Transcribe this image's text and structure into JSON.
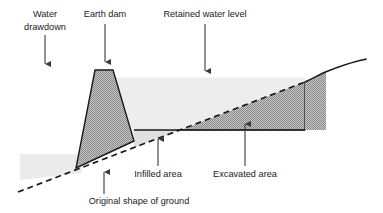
{
  "figure": {
    "type": "cross-section-diagram",
    "width": 383,
    "height": 213,
    "background": "#ffffff"
  },
  "labels": {
    "water_drawdown_line1": "Water",
    "water_drawdown_line2": "drawdown",
    "earth_dam": "Earth dam",
    "retained_water_level": "Retained water level",
    "infilled_area": "Infilled area",
    "excavated_area": "Excavated area",
    "original_shape_of_ground": "Original shape of ground"
  },
  "colors": {
    "outline": "#1a1a1a",
    "dam_fill": "#a9a9a9",
    "excavated_fill": "#9e9e9e",
    "retained_water_fill": "#ededed",
    "drawdown_water_fill": "#ebebeb",
    "infilled_fill": "#e0e0e0",
    "text": "#1a1a1a",
    "arrow": "#3a3a3a"
  },
  "geometry": {
    "original_ground_dashed": {
      "from": [
        18,
        192
      ],
      "to": [
        305,
        82
      ],
      "style": "dashed"
    },
    "right_ground_curve": {
      "points": [
        [
          305,
          82
        ],
        [
          318,
          76
        ],
        [
          332,
          71
        ],
        [
          345,
          67
        ],
        [
          356,
          63
        ],
        [
          363,
          61
        ],
        [
          366,
          60
        ]
      ],
      "style": "solid-curved"
    },
    "dam": {
      "crest_left": [
        95,
        70
      ],
      "crest_right": [
        113,
        70
      ],
      "toe_left": [
        76,
        168
      ],
      "toe_right": [
        134,
        141
      ]
    },
    "retained_water_surface_y": 78,
    "reservoir_floor_y": 130,
    "reservoir_floor_from_x": 134,
    "reservoir_floor_to_x": 305,
    "drawdown_pool": {
      "left_x": 20,
      "surface_y": 154,
      "right_x": 82
    },
    "excavated_area_start_x": 181,
    "infilled_area_span_x": [
      134,
      181
    ]
  },
  "annotations": [
    {
      "name": "water-drawdown",
      "text_x": 45,
      "text_y": 18,
      "arrow_from": [
        45,
        33
      ],
      "arrow_to": [
        45,
        70
      ],
      "direction": "down"
    },
    {
      "name": "earth-dam",
      "text_x": 105,
      "text_y": 18,
      "arrow_from": [
        105,
        24
      ],
      "arrow_to": [
        105,
        68
      ],
      "direction": "down"
    },
    {
      "name": "retained-water-level",
      "text_x": 205,
      "text_y": 18,
      "arrow_from": [
        205,
        24
      ],
      "arrow_to": [
        205,
        77
      ],
      "direction": "down"
    },
    {
      "name": "infilled-area",
      "text_x": 158,
      "text_y": 175,
      "arrow_from": [
        158,
        168
      ],
      "arrow_to": [
        158,
        133
      ],
      "direction": "up"
    },
    {
      "name": "excavated-area",
      "text_x": 245,
      "text_y": 175,
      "arrow_from": [
        245,
        168
      ],
      "arrow_to": [
        245,
        118
      ],
      "direction": "up"
    },
    {
      "name": "original-shape-of-ground",
      "text_x": 139,
      "text_y": 202,
      "arrow_from": [
        104,
        196
      ],
      "arrow_to": [
        104,
        166
      ],
      "direction": "up"
    }
  ]
}
